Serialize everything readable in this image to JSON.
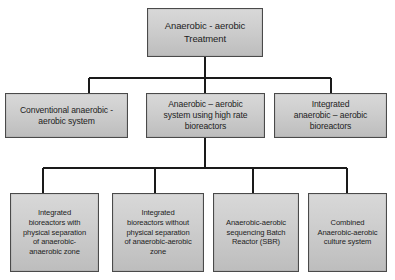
{
  "diagram": {
    "type": "flowchart",
    "orientation": "top-down",
    "levels": 3,
    "style": {
      "box_fill": "#cfcfcf",
      "box_border": "#4a4a4a",
      "line_color": "#1a1a1a",
      "text_color": "#1d1d1d",
      "background": "#ffffff"
    },
    "root": {
      "label": "Anaerobic - aerobic\nTreatment"
    },
    "level2": [
      {
        "label": "Conventional anaerobic -\naerobic system"
      },
      {
        "label": "Anaerobic – aerobic\nsystem using high rate\nbioreactors"
      },
      {
        "label": "Integrated\nanaerobic – aerobic\nbioreactors"
      }
    ],
    "level3_parent_index": 1,
    "level3": [
      {
        "label": "Integrated\nbioreactors with\nphysical separation\nof anaerobic-\nanaerobic zone"
      },
      {
        "label": "Integrated\nbioreactors without\nphysical separation\nof anaerobic-aerobic\nzone"
      },
      {
        "label": "Anaerobic-aerobic\nsequencing Batch\nReactor (SBR)"
      },
      {
        "label": "Combined\nAnaerobic-aerobic\nculture system"
      }
    ]
  }
}
